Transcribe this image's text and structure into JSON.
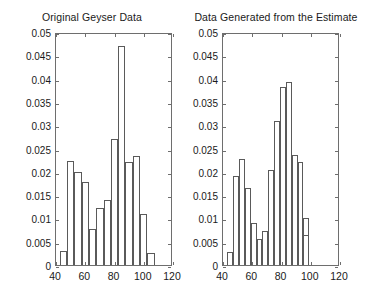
{
  "figure": {
    "background": "#ffffff",
    "axis_color": "#6e6e6e",
    "bar_edge_color": "#5a5a5a",
    "text_color": "#1a1a1a"
  },
  "panels": [
    {
      "title": "Original Geyser Data",
      "yticklabels": [
        "0",
        "0.005",
        "0.01",
        "0.015",
        "0.02",
        "0.025",
        "0.03",
        "0.035",
        "0.04",
        "0.045",
        "0.05"
      ],
      "xticklabels": [
        "40",
        "60",
        "80",
        "100",
        "120"
      ]
    },
    {
      "title": "Data Generated from the Estimate",
      "yticklabels": [
        "0",
        "0.005",
        "0.01",
        "0.015",
        "0.02",
        "0.025",
        "0.03",
        "0.035",
        "0.04",
        "0.045",
        "0.05"
      ],
      "xticklabels": [
        "40",
        "60",
        "80",
        "100",
        "120"
      ]
    }
  ],
  "chart_data": [
    {
      "type": "bar",
      "title": "Original Geyser Data",
      "xlabel": "",
      "ylabel": "",
      "xlim": [
        40,
        120
      ],
      "ylim": [
        0,
        0.05
      ],
      "yticks": [
        0,
        0.005,
        0.01,
        0.015,
        0.02,
        0.025,
        0.03,
        0.035,
        0.04,
        0.045,
        0.05
      ],
      "xticks": [
        40,
        60,
        80,
        100,
        120
      ],
      "grid": false,
      "legend": "none",
      "bin_width": 5,
      "bin_edges": [
        42.5,
        47.5,
        52.5,
        57.5,
        62.5,
        67.5,
        72.5,
        77.5,
        82.5,
        87.5,
        92.5,
        97.5,
        102.5,
        107.5
      ],
      "categories": [
        "42.5-47.5",
        "47.5-52.5",
        "52.5-57.5",
        "57.5-62.5",
        "62.5-67.5",
        "67.5-72.5",
        "72.5-77.5",
        "77.5-82.5",
        "82.5-87.5",
        "87.5-92.5",
        "92.5-97.5",
        "97.5-102.5",
        "102.5-107.5"
      ],
      "values": [
        0.003,
        0.0223,
        0.02,
        0.0178,
        0.0078,
        0.0122,
        0.014,
        0.027,
        0.047,
        0.0222,
        0.0233,
        0.011,
        0.0025
      ]
    },
    {
      "type": "bar",
      "title": "Data Generated from the Estimate",
      "xlabel": "",
      "ylabel": "",
      "xlim": [
        40,
        120
      ],
      "ylim": [
        0,
        0.05
      ],
      "yticks": [
        0,
        0.005,
        0.01,
        0.015,
        0.02,
        0.025,
        0.03,
        0.035,
        0.04,
        0.045,
        0.05
      ],
      "xticks": [
        40,
        60,
        80,
        100,
        120
      ],
      "grid": false,
      "legend": "none",
      "bin_width": 4,
      "bin_edges": [
        43,
        47,
        51,
        55,
        59,
        63,
        67,
        71,
        75,
        79,
        83,
        87,
        91,
        95,
        99
      ],
      "categories": [
        "43-47",
        "47-51",
        "51-55",
        "55-59",
        "59-63",
        "63-67",
        "67-71",
        "71-75",
        "75-79",
        "79-83",
        "83-87",
        "87-91",
        "91-95",
        "95-99"
      ],
      "values": [
        0.0028,
        0.019,
        0.0228,
        0.0166,
        0.009,
        0.0055,
        0.0073,
        0.0203,
        0.031,
        0.0383,
        0.0393,
        0.0237,
        0.022,
        0.0101
      ]
    }
  ],
  "extra_bars_panel2": {
    "note_values": [
      0.0065
    ]
  }
}
